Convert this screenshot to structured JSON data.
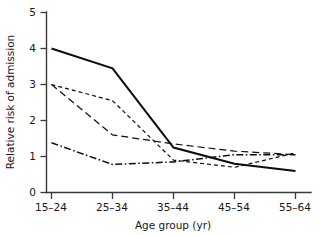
{
  "chart_data": {
    "type": "line",
    "title": "",
    "xlabel": "Age group (yr)",
    "ylabel": "Relative risk of admission",
    "categories": [
      "15–24",
      "25–34",
      "35–44",
      "45–54",
      "55–64"
    ],
    "ylim": [
      0,
      5
    ],
    "yticks": [
      0,
      1,
      2,
      3,
      4,
      5
    ],
    "ytick_labels": [
      "0",
      "1",
      "2",
      "3",
      "4",
      "5"
    ],
    "grid": false,
    "legend": "none",
    "series": [
      {
        "name": "series-solid",
        "style": "solid",
        "color": "#0d0d0d",
        "values": [
          4.0,
          3.45,
          1.25,
          0.8,
          0.6
        ]
      },
      {
        "name": "series-long-dash",
        "style": "long-dash",
        "color": "#0d0d0d",
        "values": [
          3.0,
          1.6,
          1.35,
          1.15,
          1.05
        ]
      },
      {
        "name": "series-short-dash",
        "style": "short-dash",
        "color": "#0d0d0d",
        "values": [
          3.0,
          2.55,
          0.9,
          0.7,
          1.1
        ]
      },
      {
        "name": "series-dash-dot",
        "style": "dash-dot",
        "color": "#0d0d0d",
        "values": [
          1.38,
          0.78,
          0.85,
          1.05,
          1.05
        ]
      }
    ]
  },
  "axis": {
    "y_title": "Relative risk of admission",
    "x_title": "Age group (yr)",
    "y_ticks": [
      "5",
      "4",
      "3",
      "2",
      "1",
      "0"
    ],
    "x_ticks": [
      "15–24",
      "25–34",
      "35–44",
      "45–54",
      "55–64"
    ]
  }
}
